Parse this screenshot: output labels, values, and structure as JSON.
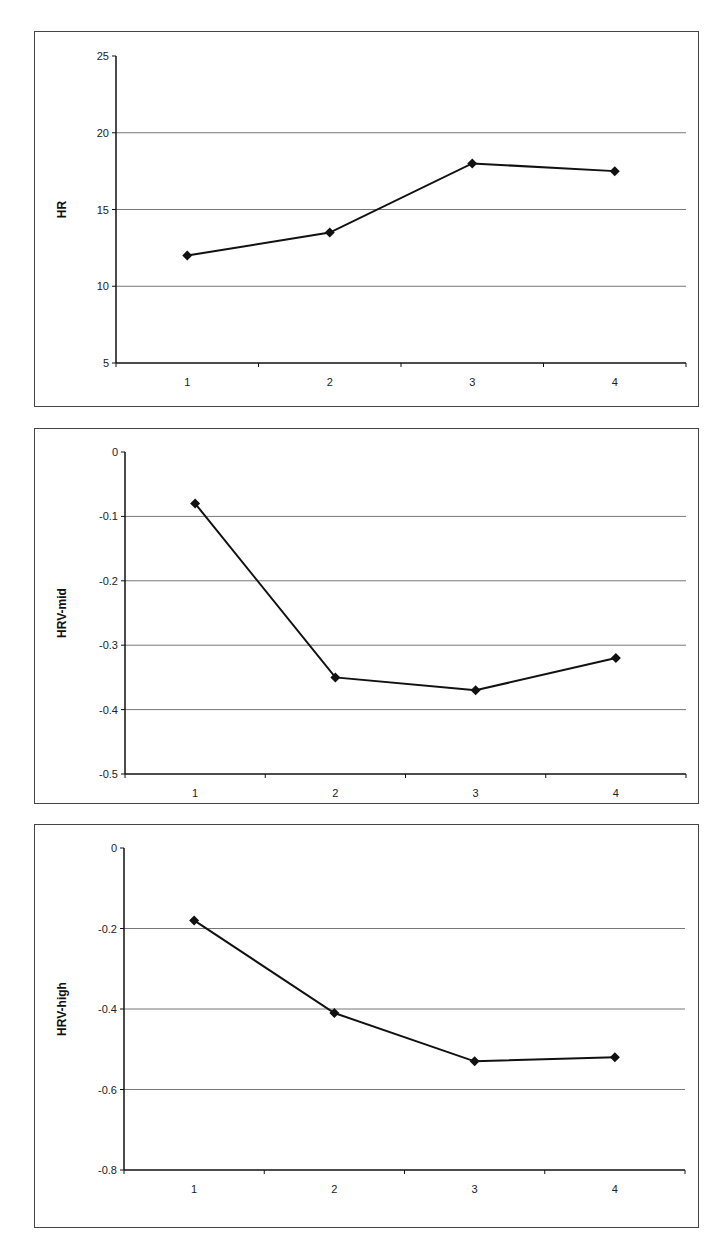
{
  "chart_data": [
    {
      "type": "line",
      "title": "",
      "xlabel": "",
      "ylabel": "HR",
      "categories": [
        "1",
        "2",
        "3",
        "4"
      ],
      "series": [
        {
          "name": "HR",
          "values": [
            12.0,
            13.5,
            18.0,
            17.5
          ]
        }
      ],
      "ylim": [
        5,
        25
      ],
      "yticks": [
        5,
        10,
        15,
        20,
        25
      ],
      "ytick_labels": [
        "5",
        "10",
        "15",
        "20",
        "25"
      ],
      "grid": true,
      "legend": "none",
      "marker": "diamond",
      "line_color": "#111111"
    },
    {
      "type": "line",
      "title": "",
      "xlabel": "",
      "ylabel": "HRV-mid",
      "categories": [
        "1",
        "2",
        "3",
        "4"
      ],
      "series": [
        {
          "name": "HRV-mid",
          "values": [
            -0.08,
            -0.35,
            -0.37,
            -0.32
          ]
        }
      ],
      "ylim": [
        -0.5,
        0
      ],
      "yticks": [
        -0.5,
        -0.4,
        -0.3,
        -0.2,
        -0.1,
        0
      ],
      "ytick_labels": [
        "-0.5",
        "-0.4",
        "-0.3",
        "-0.2",
        "-0.1",
        "0"
      ],
      "grid": true,
      "legend": "none",
      "marker": "diamond",
      "line_color": "#111111"
    },
    {
      "type": "line",
      "title": "",
      "xlabel": "",
      "ylabel": "HRV-high",
      "categories": [
        "1",
        "2",
        "3",
        "4"
      ],
      "series": [
        {
          "name": "HRV-high",
          "values": [
            -0.18,
            -0.41,
            -0.53,
            -0.52
          ]
        }
      ],
      "ylim": [
        -0.8,
        0
      ],
      "yticks": [
        -0.8,
        -0.6,
        -0.4,
        -0.2,
        0
      ],
      "ytick_labels": [
        "-0.8",
        "-0.6",
        "-0.4",
        "-0.2",
        "0"
      ],
      "grid": true,
      "legend": "none",
      "marker": "diamond",
      "line_color": "#111111"
    }
  ]
}
